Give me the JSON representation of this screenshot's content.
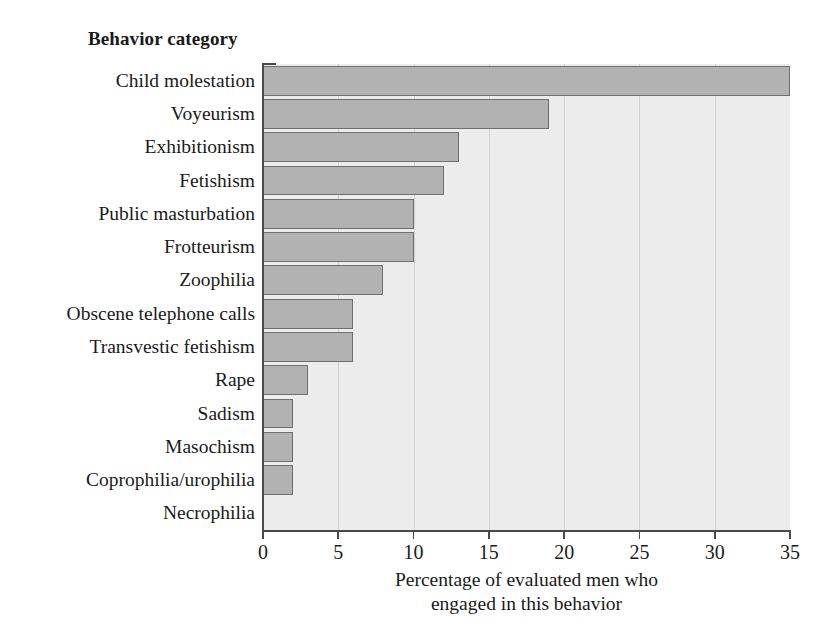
{
  "chart_data": {
    "type": "bar",
    "orientation": "horizontal",
    "title": "Behavior category",
    "xlabel_line1": "Percentage of evaluated men who",
    "xlabel_line2": "engaged in this behavior",
    "ylabel": "",
    "categories": [
      "Child molestation",
      "Voyeurism",
      "Exhibitionism",
      "Fetishism",
      "Public masturbation",
      "Frotteurism",
      "Zoophilia",
      "Obscene telephone calls",
      "Transvestic fetishism",
      "Rape",
      "Sadism",
      "Masochism",
      "Coprophilia/urophilia",
      "Necrophilia"
    ],
    "values": [
      35,
      19,
      13,
      12,
      10,
      10,
      8,
      6,
      6,
      3,
      2,
      2,
      2,
      0
    ],
    "xlim": [
      0,
      35
    ],
    "xticks": [
      0,
      5,
      10,
      15,
      20,
      25,
      30,
      35
    ],
    "xtick_labels": [
      "0",
      "5",
      "10",
      "15",
      "20",
      "25",
      "30",
      "35"
    ],
    "grid": "vertical",
    "legend": "none",
    "colors": {
      "bar_fill": "#b2b2b2",
      "bar_border": "#6f6f6f",
      "plot_background": "#ececec",
      "gridline": "#d2d2d2",
      "axis": "#4a4a4a",
      "text": "#1a1a1a",
      "page_background": "#ffffff"
    }
  }
}
